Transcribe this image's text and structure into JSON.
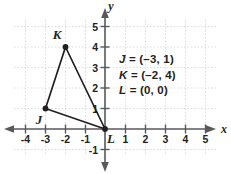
{
  "figure": {
    "type": "coordinate-plane-triangle",
    "axis_labels": {
      "x": "x",
      "y": "y"
    },
    "x_ticks": [
      "-4",
      "-3",
      "-2",
      "-1",
      "1",
      "2",
      "3",
      "4",
      "5"
    ],
    "y_ticks": [
      "5",
      "4",
      "3",
      "2",
      "1",
      "-1"
    ],
    "origin_label": "L",
    "grid": "dotted",
    "colors": {
      "grid": "#d9dde0",
      "axis": "#58595b",
      "shape": "#231f20",
      "text": "#231f20"
    }
  },
  "points": [
    {
      "name": "J",
      "label": "J",
      "x": -3,
      "y": 1
    },
    {
      "name": "K",
      "label": "K",
      "x": -2,
      "y": 4
    },
    {
      "name": "L",
      "label": "L",
      "x": 0,
      "y": 0
    }
  ],
  "legend": [
    {
      "var": "J",
      "eq": "= (–3, 1)"
    },
    {
      "var": "K",
      "eq": "= (–2, 4)"
    },
    {
      "var": "L",
      "eq": "= (0, 0)"
    }
  ]
}
